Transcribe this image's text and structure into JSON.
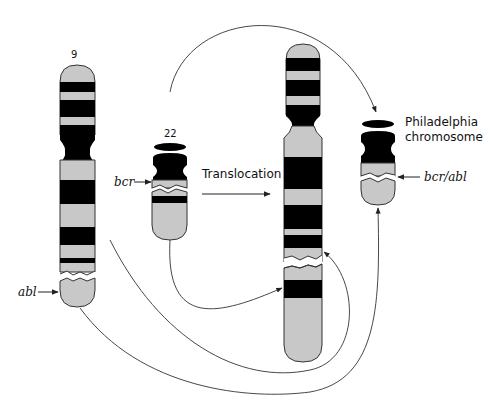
{
  "diagram": {
    "colors": {
      "band_dark": "#000000",
      "band_light": "#c8c8c8",
      "outline": "#333333",
      "background": "#ffffff"
    },
    "chromosomes": [
      {
        "id": "chr9",
        "label": "9"
      },
      {
        "id": "chr22",
        "label": "22"
      },
      {
        "id": "der9",
        "label": ""
      },
      {
        "id": "philadelphia",
        "label": "Philadelphia chromosome"
      }
    ],
    "labels": {
      "chr9": "9",
      "chr22": "22",
      "bcr": "bcr",
      "abl": "abl",
      "bcr_abl": "bcr/abl",
      "translocation": "Translocation",
      "philadelphia_line1": "Philadelphia",
      "philadelphia_line2": "chromosome"
    },
    "caption": ""
  }
}
